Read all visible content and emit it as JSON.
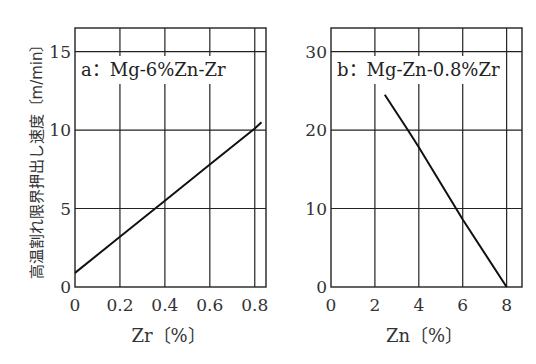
{
  "figure": {
    "ylabel": "高温割れ限界押出し速度〔m/min〕"
  },
  "chart_data": [
    {
      "type": "line",
      "title": "a：Mg-6%Zn-Zr",
      "xlabel": "Zr〔%〕",
      "ylabel": "高温割れ限界押出し速度〔m/min〕",
      "xlim": [
        0,
        0.85
      ],
      "ylim": [
        0,
        16.5
      ],
      "xticks": [
        "0",
        "0.2",
        "0.4",
        "0.6",
        "0.8"
      ],
      "xtick_values": [
        0,
        0.2,
        0.4,
        0.6,
        0.8
      ],
      "yticks": [
        "0",
        "5",
        "10",
        "15"
      ],
      "ytick_values": [
        0,
        5,
        10,
        15
      ],
      "grid": true,
      "series": [
        {
          "name": "Mg-6%Zn-Zr",
          "x": [
            0,
            0.2,
            0.4,
            0.6,
            0.8,
            0.83
          ],
          "y": [
            0.9,
            3.2,
            5.5,
            7.8,
            10.1,
            10.5
          ]
        }
      ]
    },
    {
      "type": "line",
      "title": "b：Mg-Zn-0.8%Zr",
      "xlabel": "Zn〔%〕",
      "ylabel": "高温割れ限界押出し速度〔m/min〕",
      "xlim": [
        0,
        8.7
      ],
      "ylim": [
        0,
        33
      ],
      "xticks": [
        "0",
        "2",
        "4",
        "6",
        "8"
      ],
      "xtick_values": [
        0,
        2,
        4,
        6,
        8
      ],
      "yticks": [
        "0",
        "10",
        "20",
        "30"
      ],
      "ytick_values": [
        0,
        10,
        20,
        30
      ],
      "grid": true,
      "series": [
        {
          "name": "Mg-Zn-0.8%Zr",
          "x": [
            2.45,
            3.5,
            4,
            6,
            8
          ],
          "y": [
            24.5,
            20,
            17.8,
            8.6,
            0
          ]
        }
      ]
    }
  ]
}
